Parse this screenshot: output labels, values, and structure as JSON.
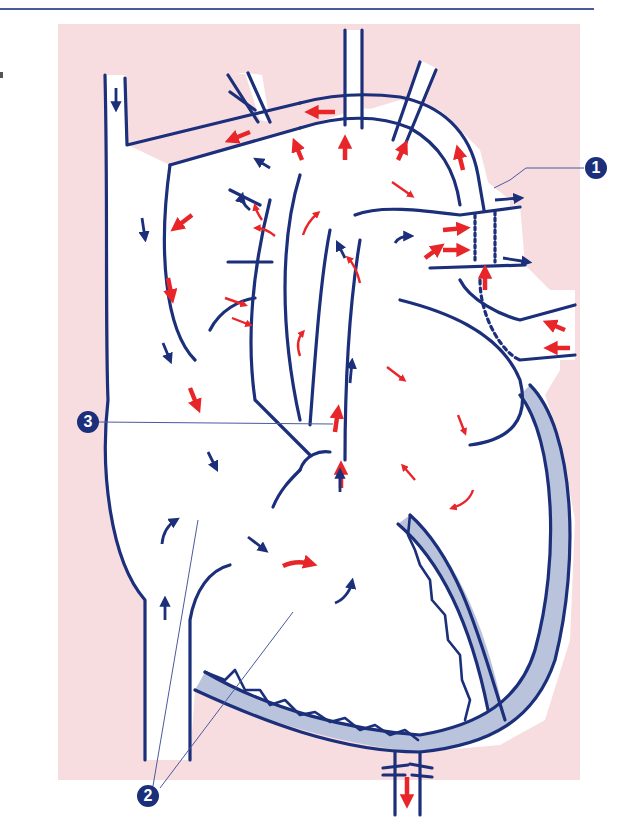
{
  "figure": {
    "colors": {
      "background_panel": "#f7dde0",
      "outline": "#1b2f7a",
      "oxygenated_flow": "#e8262a",
      "deoxygenated_flow": "#1b2f7a",
      "myocardium": "#b9c3db",
      "vessel_fill": "#ffffff",
      "top_rule": "#4a5a9c"
    }
  },
  "callouts": [
    {
      "number": "1",
      "label": "1"
    },
    {
      "number": "2",
      "label": "2"
    },
    {
      "number": "3",
      "label": "3"
    }
  ]
}
